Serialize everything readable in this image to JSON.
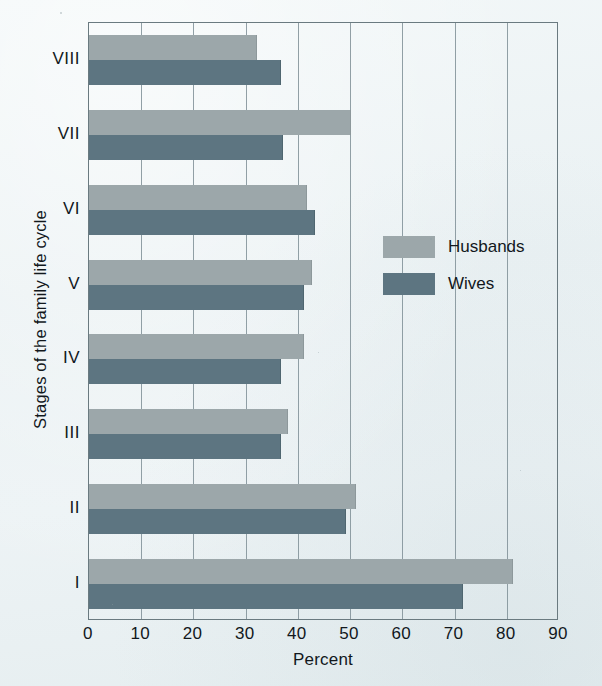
{
  "chart_data": {
    "type": "bar",
    "orientation": "horizontal",
    "title": "",
    "xlabel": "Percent",
    "ylabel": "Stages of the family life cycle",
    "xlim": [
      0,
      90
    ],
    "xticks": [
      0,
      10,
      20,
      30,
      40,
      50,
      60,
      70,
      80,
      90
    ],
    "grid": "vertical",
    "categories": [
      "I",
      "II",
      "III",
      "IV",
      "V",
      "VI",
      "VII",
      "VIII"
    ],
    "category_order_top_to_bottom": [
      "VIII",
      "VII",
      "VI",
      "V",
      "IV",
      "III",
      "II",
      "I"
    ],
    "series": [
      {
        "name": "Husbands",
        "color": "#9ca7aa",
        "values": [
          81,
          51,
          38,
          41,
          42.5,
          41.5,
          50,
          32
        ]
      },
      {
        "name": "Wives",
        "color": "#5d7581",
        "values": [
          71.5,
          49,
          36.5,
          36.5,
          41,
          43,
          37,
          36.5
        ]
      }
    ],
    "legend": {
      "position": "inside-right",
      "entries": [
        {
          "label": "Husbands",
          "color": "#9ca7aa",
          "icon": "legend-swatch-icon"
        },
        {
          "label": "Wives",
          "color": "#5d7581",
          "icon": "legend-swatch-icon"
        }
      ]
    }
  },
  "colors": {
    "background": "#eef4f6",
    "axis": "#6a7a80",
    "gridline": "#7f8f96",
    "husbands": "#9ca7aa",
    "wives": "#5d7581",
    "text": "#12181c"
  }
}
